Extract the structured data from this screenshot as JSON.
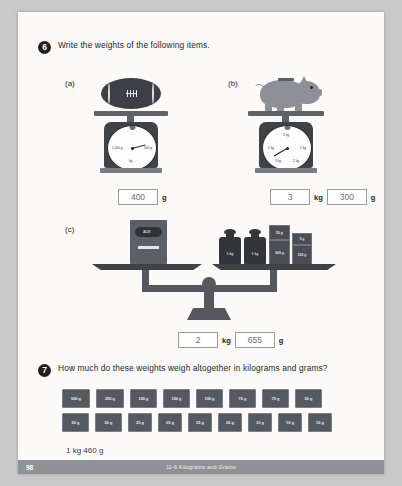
{
  "worksheet": {
    "q6": {
      "number": "6",
      "text": "Write the weights of the following items.",
      "parts": {
        "a": {
          "label": "(a)",
          "item": "football",
          "dial_left": "1,000 g",
          "dial_right": "500 g",
          "dial_bottom": "kg",
          "answer_value": "400",
          "answer_unit": "g"
        },
        "b": {
          "label": "(b)",
          "item": "piggy-bank",
          "dial_top": "3 kg",
          "dial_left": "4 kg",
          "dial_right": "1 kg",
          "dial_bottom_left": "3 kg",
          "dial_bottom_right": "2 kg",
          "answer_kg_value": "3",
          "answer_kg_unit": "kg",
          "answer_g_value": "300",
          "answer_g_unit": "g"
        },
        "c": {
          "label": "(c)",
          "item": "toaster-on-balance",
          "toaster_label": "AUX",
          "weights": [
            {
              "name": "bottle-weight-1",
              "label": "1 kg"
            },
            {
              "name": "bottle-weight-2",
              "label": "1 kg"
            },
            {
              "name": "cube-weight-50g",
              "label": "50 g"
            },
            {
              "name": "cube-weight-5g",
              "label": "5 g"
            },
            {
              "name": "cube-weight-500g",
              "label": "500 g"
            },
            {
              "name": "cube-weight-100g",
              "label": "100 g"
            }
          ],
          "answer_kg_value": "2",
          "answer_kg_unit": "kg",
          "answer_g_value": "655",
          "answer_g_unit": "g"
        }
      }
    },
    "q7": {
      "number": "7",
      "text": "How much do these weights weigh altogether in kilograms and grams?",
      "row1": [
        "500 g",
        "250 g",
        "100 g",
        "100 g",
        "100 g",
        "75 g",
        "75 g",
        "50 g"
      ],
      "row2": [
        "50 g",
        "50 g",
        "25 g",
        "25 g",
        "25 g",
        "20 g",
        "10 g",
        "10 g",
        "10 g"
      ],
      "answer": "1 kg 460 g"
    }
  },
  "footer": {
    "page_number": "98",
    "title": "11-6  Kilograms and Grams"
  }
}
